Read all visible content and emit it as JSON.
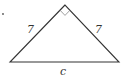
{
  "diagram": {
    "type": "right isosceles triangle",
    "labels": {
      "left_leg": "7",
      "right_leg": "7",
      "hypotenuse": "c"
    },
    "vertices": {
      "apex": [
        65,
        5
      ],
      "bottom_left": [
        10,
        62
      ],
      "bottom_right": [
        119,
        62
      ]
    },
    "right_angle_at": "apex",
    "colors": {
      "stroke": "#333333",
      "marker": "#888888",
      "background": "#ffffff"
    }
  }
}
